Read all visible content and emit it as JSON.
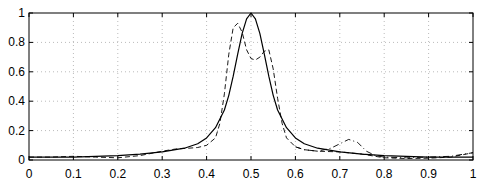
{
  "chart_data": {
    "type": "line",
    "title": "",
    "xlabel": "",
    "ylabel": "",
    "xlim": [
      0,
      1
    ],
    "ylim": [
      0,
      1
    ],
    "grid": true,
    "legend": null,
    "x_ticks": [
      "0",
      "0.1",
      "0.2",
      "0.3",
      "0.4",
      "0.5",
      "0.6",
      "0.7",
      "0.8",
      "0.9",
      "1"
    ],
    "y_ticks": [
      "0",
      "0.2",
      "0.4",
      "0.6",
      "0.8",
      "1"
    ],
    "series": [
      {
        "name": "solid",
        "style": "solid",
        "x": [
          0,
          0.05,
          0.1,
          0.15,
          0.2,
          0.25,
          0.3,
          0.35,
          0.38,
          0.4,
          0.42,
          0.44,
          0.45,
          0.46,
          0.47,
          0.48,
          0.49,
          0.5,
          0.51,
          0.52,
          0.53,
          0.54,
          0.55,
          0.56,
          0.58,
          0.6,
          0.62,
          0.65,
          0.7,
          0.75,
          0.8,
          0.85,
          0.9,
          0.95,
          1
        ],
        "y": [
          0.02,
          0.02,
          0.02,
          0.025,
          0.03,
          0.04,
          0.055,
          0.08,
          0.11,
          0.15,
          0.22,
          0.34,
          0.44,
          0.57,
          0.72,
          0.86,
          0.96,
          1.0,
          0.96,
          0.86,
          0.72,
          0.57,
          0.44,
          0.34,
          0.22,
          0.15,
          0.11,
          0.08,
          0.055,
          0.04,
          0.03,
          0.025,
          0.02,
          0.02,
          0.02
        ]
      },
      {
        "name": "dashed",
        "style": "dashed",
        "x": [
          0,
          0.05,
          0.1,
          0.15,
          0.2,
          0.25,
          0.3,
          0.33,
          0.36,
          0.38,
          0.4,
          0.42,
          0.43,
          0.44,
          0.45,
          0.46,
          0.47,
          0.48,
          0.49,
          0.5,
          0.51,
          0.52,
          0.53,
          0.54,
          0.55,
          0.56,
          0.57,
          0.58,
          0.6,
          0.62,
          0.65,
          0.7,
          0.75,
          0.8,
          0.85,
          0.9,
          0.95,
          1
        ],
        "y": [
          0.02,
          0.02,
          0.025,
          0.02,
          0.015,
          0.03,
          0.06,
          0.075,
          0.08,
          0.085,
          0.1,
          0.15,
          0.25,
          0.45,
          0.72,
          0.9,
          0.93,
          0.87,
          0.75,
          0.69,
          0.68,
          0.7,
          0.74,
          0.75,
          0.62,
          0.42,
          0.25,
          0.15,
          0.09,
          0.07,
          0.06,
          0.055,
          0.04,
          0.015,
          0.01,
          0.012,
          0.02,
          0.05
        ]
      },
      {
        "name": "dash-dot",
        "style": "dashdot",
        "x": [
          0.6,
          0.62,
          0.65,
          0.68,
          0.7,
          0.72,
          0.74,
          0.76,
          0.78,
          0.8,
          0.85,
          0.9,
          0.95,
          0.98,
          1
        ],
        "y": [
          0.09,
          0.07,
          0.06,
          0.08,
          0.11,
          0.14,
          0.12,
          0.06,
          0.03,
          0.02,
          0.015,
          0.02,
          0.025,
          0.04,
          0.05
        ]
      }
    ]
  }
}
